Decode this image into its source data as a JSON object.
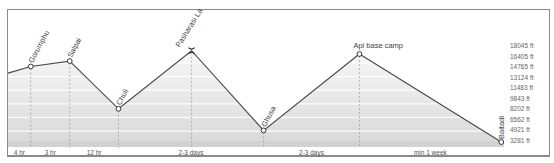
{
  "chart_data": {
    "type": "area",
    "title": "",
    "xlabel": "",
    "ylabel": "Elevation",
    "grid": true,
    "unit": "ft",
    "y_ticks": [
      18045,
      16405,
      14765,
      13124,
      11483,
      9843,
      8202,
      6562,
      4921,
      3281
    ],
    "y_tick_labels": [
      "18045 ft",
      "16405 ft",
      "14765 ft",
      "13124 ft",
      "11483 ft",
      "9843 ft",
      "8202 ft",
      "6562 ft",
      "4921 ft",
      "3281 ft"
    ],
    "ylim": [
      2400,
      18900
    ],
    "points": [
      {
        "name": "",
        "x": 0,
        "elevation": 11300,
        "marker": "none"
      },
      {
        "name": "Gorumphu",
        "x": 4.2,
        "elevation": 12100,
        "marker": "circle"
      },
      {
        "name": "Salpai",
        "x": 11.4,
        "elevation": 12750,
        "marker": "circle"
      },
      {
        "name": "Chuli",
        "x": 20.4,
        "elevation": 7000,
        "marker": "circle"
      },
      {
        "name": "Pasharasi La",
        "x": 33.9,
        "elevation": 14000,
        "marker": "pass"
      },
      {
        "name": "Ghusa",
        "x": 47.2,
        "elevation": 4400,
        "marker": "circle"
      },
      {
        "name": "Api base camp",
        "x": 64.9,
        "elevation": 13600,
        "marker": "circle"
      },
      {
        "name": "Baitadi",
        "x": 91.1,
        "elevation": 3000,
        "marker": "circle"
      }
    ],
    "segments": [
      {
        "label": "4 hr",
        "from": 0,
        "to": 4.2
      },
      {
        "label": "3 hr",
        "from": 4.2,
        "to": 11.4
      },
      {
        "label": "12 hr",
        "from": 11.4,
        "to": 20.4
      },
      {
        "label": "2-3 days",
        "from": 20.4,
        "to": 47.2
      },
      {
        "label": "2-3 days",
        "from": 47.2,
        "to": 64.9
      },
      {
        "label": "min 1 week",
        "from": 64.9,
        "to": 91.1
      }
    ],
    "xlim": [
      0,
      91.6
    ],
    "colors": {
      "line": "#4a4a4a",
      "band_light": "#f4f4f4",
      "band_dark": "#dcdcdc",
      "stripe": "#ffffff",
      "frame": "#8a8a8a"
    }
  }
}
